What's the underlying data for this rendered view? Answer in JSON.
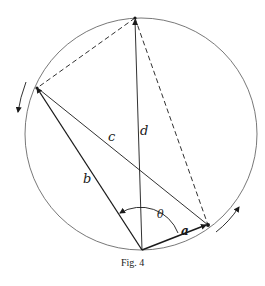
{
  "figure": {
    "caption": "Fig. 4",
    "labels": {
      "a": "a",
      "b": "b",
      "c": "c",
      "d": "d",
      "theta": "θ"
    },
    "colors": {
      "stroke": "#1a1a1a",
      "circle": "#444444",
      "background": "#ffffff"
    },
    "elements": {
      "circle": {
        "cx": 141,
        "cy": 134,
        "r": 116
      },
      "points": {
        "top": [
          135,
          18
        ],
        "left": [
          37,
          88
        ],
        "bottom": [
          142,
          250
        ],
        "right": [
          208,
          225
        ]
      },
      "solid_segments": [
        "b: left-bottom",
        "c: left-right",
        "d: bottom-top",
        "a: bottom-right"
      ],
      "dashed_segments": [
        "top-left",
        "top-right"
      ],
      "rotation_arrows": [
        "left: counter-clockwise downward",
        "right: upward along circle"
      ]
    }
  }
}
